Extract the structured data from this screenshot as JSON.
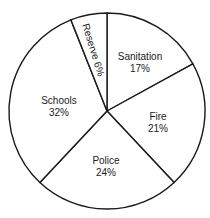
{
  "chart_data": {
    "type": "pie",
    "title": "",
    "categories": [
      "Sanitation",
      "Fire",
      "Police",
      "Schools",
      "Reserve"
    ],
    "values": [
      17,
      21,
      24,
      32,
      6
    ],
    "unit": "%",
    "start_angle": "top, clockwise",
    "labels": [
      {
        "name": "Sanitation",
        "pct": "17%"
      },
      {
        "name": "Fire",
        "pct": "21%"
      },
      {
        "name": "Police",
        "pct": "24%"
      },
      {
        "name": "Schools",
        "pct": "32%"
      },
      {
        "name": "Reserve",
        "pct": "6%",
        "rotated": true
      }
    ]
  }
}
